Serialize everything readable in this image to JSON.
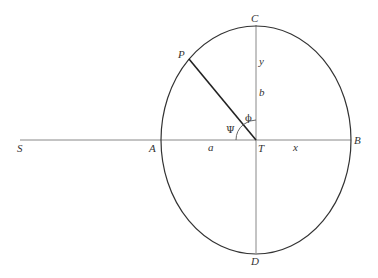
{
  "diagram": {
    "type": "ellipse-geometry",
    "points": {
      "S": {
        "label": "S",
        "x": 20,
        "y": 140
      },
      "A": {
        "label": "A",
        "x": 161,
        "y": 140
      },
      "T": {
        "label": "T",
        "x": 256,
        "y": 140
      },
      "B": {
        "label": "B",
        "x": 351,
        "y": 140
      },
      "C": {
        "label": "C",
        "x": 256,
        "y": 25
      },
      "D": {
        "label": "D",
        "x": 256,
        "y": 253
      },
      "P": {
        "label": "P",
        "x": 189,
        "y": 59
      }
    },
    "segment_labels": {
      "a": "a",
      "x": "x",
      "y": "y",
      "b": "b"
    },
    "angle_labels": {
      "phi": "ϕ",
      "psi": "Ψ"
    },
    "ellipse": {
      "cx": 256,
      "cy": 140,
      "rx": 95,
      "ry": 114
    },
    "colors": {
      "stroke": "#333333",
      "axis": "#888888",
      "background": "#ffffff"
    }
  }
}
